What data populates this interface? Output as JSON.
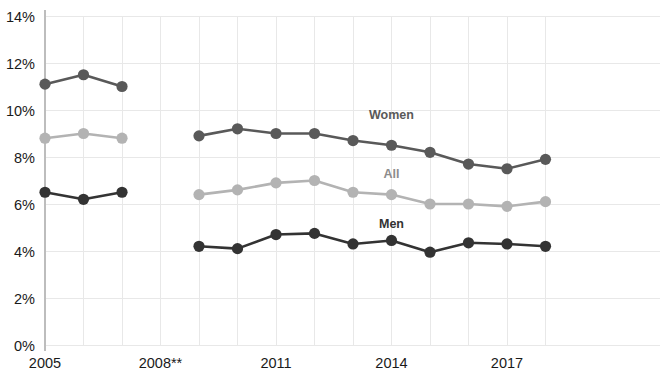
{
  "chart_data": {
    "type": "line",
    "title": "",
    "xlabel": "",
    "ylabel": "",
    "ylim": [
      0,
      14
    ],
    "ytick_values": [
      0,
      2,
      4,
      6,
      8,
      10,
      12,
      14
    ],
    "ytick_labels": [
      "0%",
      "2%",
      "4%",
      "6%",
      "8%",
      "10%",
      "12%",
      "14%"
    ],
    "x": [
      2005,
      2006,
      2007,
      2008,
      2009,
      2010,
      2011,
      2012,
      2013,
      2014,
      2015,
      2016,
      2017,
      2018
    ],
    "xtick_positions": [
      2005,
      2008,
      2011,
      2014,
      2017
    ],
    "xtick_labels": [
      "2005",
      "2008**",
      "2011",
      "2014",
      "2017"
    ],
    "grid": true,
    "legend_position": "inline-annotations",
    "gap_note": "Series are broken at 2008; no data point plotted for 2008",
    "series": [
      {
        "name": "Women",
        "color": "#595959",
        "label_x": 2014,
        "label_y": 9.6,
        "values": [
          11.1,
          11.5,
          11.0,
          null,
          8.9,
          9.2,
          9.0,
          9.0,
          8.7,
          8.5,
          8.2,
          7.7,
          7.5,
          7.9
        ]
      },
      {
        "name": "All",
        "color": "#b3b3b3",
        "label_x": 2014,
        "label_y": 7.1,
        "values": [
          8.8,
          9.0,
          8.8,
          null,
          6.4,
          6.6,
          6.9,
          7.0,
          6.5,
          6.4,
          6.0,
          6.0,
          5.9,
          6.1
        ]
      },
      {
        "name": "Men",
        "color": "#333333",
        "label_x": 2014,
        "label_y": 5.0,
        "values": [
          6.5,
          6.2,
          6.5,
          null,
          4.2,
          4.1,
          4.7,
          4.75,
          4.3,
          4.45,
          3.95,
          4.35,
          4.3,
          4.2
        ]
      }
    ]
  },
  "colors": {
    "gridline": "#e8e8e8",
    "axis": "#bdbdbd",
    "tick_text": "#1a1a1a",
    "background": "#ffffff"
  }
}
